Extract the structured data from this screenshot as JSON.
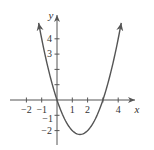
{
  "chart_data": {
    "type": "line",
    "title": "",
    "xlabel": "x",
    "ylabel": "y",
    "function": "y = x^2 - 3x",
    "xlim": [
      -2.6,
      5.2
    ],
    "ylim": [
      -2.9,
      5.3
    ],
    "x_ticks": [
      -2,
      -1,
      1,
      2,
      3,
      4
    ],
    "x_tick_labels": [
      "−2",
      "−1",
      "1",
      "2",
      "",
      "4"
    ],
    "y_ticks": [
      -2,
      -1,
      1,
      2,
      3,
      4
    ],
    "y_tick_labels": [
      "−2",
      "−1",
      "",
      "",
      "3",
      "4"
    ],
    "grid": false,
    "series": [
      {
        "name": "parabola",
        "color": "#555555",
        "x": [
          -1.2,
          -1,
          -0.5,
          0,
          0.5,
          1,
          1.5,
          2,
          2.5,
          3,
          3.5,
          4,
          4.2
        ],
        "y": [
          5.04,
          4,
          1.75,
          0,
          -1.25,
          -2,
          -2.25,
          -2,
          -1.25,
          0,
          1.75,
          4,
          5.04
        ]
      }
    ],
    "key_points": {
      "roots": [
        0,
        3
      ],
      "vertex": [
        1.5,
        -2.25
      ]
    },
    "curve_end_arrows": true
  },
  "labels": {
    "x_axis": "x",
    "y_axis": "y",
    "x_tick_neg2": "−2",
    "x_tick_neg1": "−1",
    "x_tick_1": "1",
    "x_tick_2": "2",
    "x_tick_4": "4",
    "y_tick_4": "4",
    "y_tick_3": "3",
    "y_tick_neg1": "−1",
    "y_tick_neg2": "−2"
  },
  "colors": {
    "axis": "#555555",
    "curve": "#555555",
    "text": "#333333"
  }
}
